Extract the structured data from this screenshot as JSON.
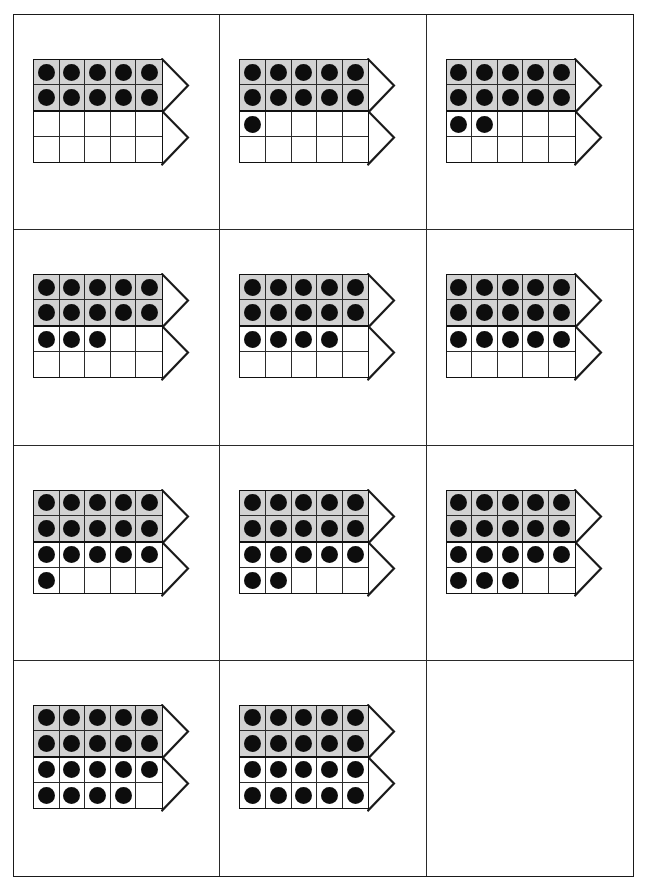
{
  "worksheet": {
    "title": "Double Ten-Frame Number Cards",
    "description": "A 3-column by 4-row grid of cards, each showing two five-by-two ten-frames with a right-pointing arrow; the top frame is shaded gray and filled with ten counters, the bottom frame is white and partially filled.",
    "columns": 3,
    "rows": 4,
    "colors": {
      "page_background": "#ffffff",
      "grid_border": "#1a1a1a",
      "cell_divider": "#2a2a2a",
      "frame_border": "#111111",
      "frame_shaded_fill": "#d2d2d2",
      "frame_plain_fill": "#ffffff",
      "counter_dot": "#0d0d0d",
      "arrow_stroke": "#1a1a1a"
    },
    "frame": {
      "columns": 5,
      "rows": 2,
      "capacity": 10
    },
    "cards": [
      {
        "id": "card-1",
        "position": "row1-col1",
        "value": 10,
        "top_frame_filled": 10,
        "bottom_frame_filled": 0,
        "shaded_top": true,
        "blank": false
      },
      {
        "id": "card-2",
        "position": "row1-col2",
        "value": 11,
        "top_frame_filled": 10,
        "bottom_frame_filled": 1,
        "shaded_top": true,
        "blank": false
      },
      {
        "id": "card-3",
        "position": "row1-col3",
        "value": 12,
        "top_frame_filled": 10,
        "bottom_frame_filled": 2,
        "shaded_top": true,
        "blank": false
      },
      {
        "id": "card-4",
        "position": "row2-col1",
        "value": 13,
        "top_frame_filled": 10,
        "bottom_frame_filled": 3,
        "shaded_top": true,
        "blank": false
      },
      {
        "id": "card-5",
        "position": "row2-col2",
        "value": 14,
        "top_frame_filled": 10,
        "bottom_frame_filled": 4,
        "shaded_top": true,
        "blank": false
      },
      {
        "id": "card-6",
        "position": "row2-col3",
        "value": 15,
        "top_frame_filled": 10,
        "bottom_frame_filled": 5,
        "shaded_top": true,
        "blank": false
      },
      {
        "id": "card-7",
        "position": "row3-col1",
        "value": 16,
        "top_frame_filled": 10,
        "bottom_frame_filled": 6,
        "shaded_top": true,
        "blank": false
      },
      {
        "id": "card-8",
        "position": "row3-col2",
        "value": 17,
        "top_frame_filled": 10,
        "bottom_frame_filled": 7,
        "shaded_top": true,
        "blank": false
      },
      {
        "id": "card-9",
        "position": "row3-col3",
        "value": 18,
        "top_frame_filled": 10,
        "bottom_frame_filled": 8,
        "shaded_top": true,
        "blank": false
      },
      {
        "id": "card-10",
        "position": "row4-col1",
        "value": 19,
        "top_frame_filled": 10,
        "bottom_frame_filled": 9,
        "shaded_top": true,
        "blank": false
      },
      {
        "id": "card-11",
        "position": "row4-col2",
        "value": 20,
        "top_frame_filled": 10,
        "bottom_frame_filled": 10,
        "shaded_top": true,
        "blank": false
      },
      {
        "id": "card-12",
        "position": "row4-col3",
        "value": null,
        "top_frame_filled": 0,
        "bottom_frame_filled": 0,
        "shaded_top": false,
        "blank": true
      }
    ],
    "icons": {
      "arrow": "right-pointing-triangle-outline",
      "counter": "filled-circle-counter"
    }
  }
}
